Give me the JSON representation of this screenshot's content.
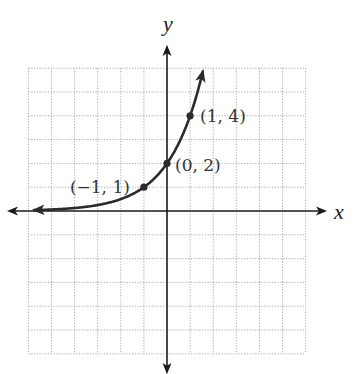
{
  "chart_data": {
    "type": "line",
    "title": "",
    "xlabel": "x",
    "ylabel": "y",
    "xlim": [
      -6,
      6
    ],
    "ylim": [
      -6,
      6
    ],
    "grid": true,
    "grid_step": 1,
    "function": "y = 2^(x+1)",
    "series": [
      {
        "name": "exponential curve",
        "x": [
          -6,
          -5,
          -4,
          -3,
          -2,
          -1,
          0,
          1,
          1.5
        ],
        "y": [
          0.03125,
          0.0625,
          0.125,
          0.25,
          0.5,
          1,
          2,
          4,
          5.66
        ],
        "arrow_both_ends": true
      }
    ],
    "points": [
      {
        "x": -1,
        "y": 1,
        "label": "(−1, 1)"
      },
      {
        "x": 0,
        "y": 2,
        "label": "(0, 2)"
      },
      {
        "x": 1,
        "y": 4,
        "label": "(1, 4)"
      }
    ],
    "legend": null
  },
  "axes": {
    "x_label": "x",
    "y_label": "y"
  },
  "style": {
    "curve_color": "#2b2b2b",
    "axis_color": "#1a1a1a",
    "grid_color": "#a8a8a8"
  }
}
